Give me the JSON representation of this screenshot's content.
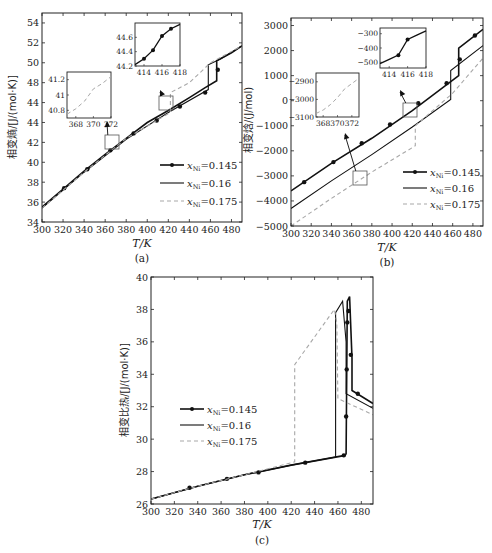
{
  "figure": {
    "panels": [
      "(a)",
      "(b)",
      "(c)"
    ]
  },
  "chart_data": [
    {
      "id": "a",
      "type": "line",
      "caption": "(a)",
      "title": "",
      "xlabel": "T/K",
      "ylabel": "相变熵/[J/(mol·K)]",
      "xlim": [
        300,
        490
      ],
      "ylim": [
        34,
        55
      ],
      "xticks": [
        300,
        320,
        340,
        360,
        380,
        400,
        420,
        440,
        460,
        480
      ],
      "yticks": [
        34,
        36,
        38,
        40,
        42,
        44,
        46,
        48,
        50,
        52,
        54
      ],
      "ytick_labels": [
        "34",
        "36",
        "38",
        "40",
        "42",
        "44",
        "44",
        "48",
        "50",
        "52",
        "54"
      ],
      "grid": false,
      "legend_position": "lower right",
      "legend": [
        "xNi=0.145",
        "xNi=0.16",
        "xNi=0.175"
      ],
      "legend_labels": [
        {
          "prefix": "x",
          "sub": "Ni",
          "suffix": "=0.145"
        },
        {
          "prefix": "x",
          "sub": "Ni",
          "suffix": "=0.16"
        },
        {
          "prefix": "x",
          "sub": "Ni",
          "suffix": "=0.175"
        }
      ],
      "series": [
        {
          "name": "xNi=0.145",
          "style": "solid-marker",
          "color": "#111111",
          "x": [
            300,
            320,
            340,
            360,
            380,
            400,
            420,
            440,
            455,
            466,
            466,
            480,
            490
          ],
          "y": [
            35.5,
            37.3,
            39.1,
            40.8,
            42.4,
            44.0,
            45.2,
            46.5,
            47.5,
            48.2,
            50.2,
            51.0,
            51.7
          ],
          "markers_x": [
            321,
            343,
            365,
            387,
            409,
            431,
            455,
            467
          ],
          "markers_y": [
            37.4,
            39.3,
            41.2,
            42.9,
            44.2,
            45.6,
            47.0,
            49.3
          ]
        },
        {
          "name": "xNi=0.16",
          "style": "solid",
          "color": "#111111",
          "x": [
            300,
            340,
            380,
            420,
            458,
            458,
            470,
            490
          ],
          "y": [
            35.4,
            39.0,
            42.3,
            45.0,
            47.3,
            49.8,
            50.4,
            51.7
          ]
        },
        {
          "name": "xNi=0.175",
          "style": "dashed",
          "color": "#aaaaaa",
          "x": [
            300,
            340,
            380,
            422,
            422,
            440,
            460,
            490
          ],
          "y": [
            35.4,
            39.0,
            42.4,
            45.0,
            47.0,
            48.0,
            50.0,
            51.7
          ]
        }
      ],
      "insets": [
        {
          "xlim": [
            367,
            372
          ],
          "ylim": [
            40.7,
            41.3
          ],
          "xticks": [
            368,
            370,
            372
          ],
          "yticks": [
            40.8,
            41,
            41.2
          ],
          "series": "xNi=0.175",
          "x": [
            367,
            368,
            369,
            370,
            371,
            372
          ],
          "y": [
            40.75,
            40.82,
            40.92,
            41.08,
            41.15,
            41.24
          ]
        },
        {
          "xlim": [
            413,
            418
          ],
          "ylim": [
            44.2,
            44.8
          ],
          "xticks": [
            414,
            416,
            418
          ],
          "yticks": [
            44.2,
            44.4,
            44.6
          ],
          "series": "xNi=0.145",
          "x": [
            413,
            414,
            415,
            416,
            417,
            418
          ],
          "y": [
            44.22,
            44.3,
            44.42,
            44.62,
            44.72,
            44.78
          ],
          "markers_x": [
            414,
            415,
            416,
            417
          ],
          "markers_y": [
            44.3,
            44.42,
            44.62,
            44.72
          ]
        }
      ]
    },
    {
      "id": "b",
      "type": "line",
      "caption": "(b)",
      "title": "",
      "xlabel": "T/K",
      "ylabel": "相变焓/(J/mol)",
      "xlim": [
        300,
        490
      ],
      "ylim": [
        -5000,
        3300
      ],
      "xticks": [
        300,
        320,
        340,
        360,
        380,
        400,
        420,
        440,
        460,
        480
      ],
      "yticks": [
        -5000,
        -4000,
        -3000,
        -2000,
        -1000,
        0,
        1000,
        2000,
        3000
      ],
      "ytick_labels": [
        "−5000",
        "−4000",
        "−3000",
        "−2000",
        "−1000",
        "0",
        "1000",
        "2000",
        "3000"
      ],
      "grid": false,
      "legend_position": "lower right",
      "legend": [
        "xNi=0.145",
        "xNi=0.16",
        "xNi=0.175"
      ],
      "legend_labels": [
        {
          "prefix": "x",
          "sub": "Ni",
          "suffix": "=0.145"
        },
        {
          "prefix": "x",
          "sub": "Ni",
          "suffix": "=0.16"
        },
        {
          "prefix": "x",
          "sub": "Ni",
          "suffix": "=0.175"
        }
      ],
      "series": [
        {
          "name": "xNi=0.145",
          "style": "solid-marker",
          "color": "#111111",
          "x": [
            300,
            340,
            380,
            420,
            466,
            466,
            490
          ],
          "y": [
            -3600,
            -2500,
            -1500,
            -400,
            1000,
            2100,
            2850
          ],
          "markers_x": [
            313,
            342,
            370,
            398,
            426,
            454,
            467,
            482
          ],
          "markers_y": [
            -3250,
            -2450,
            -1700,
            -950,
            -100,
            700,
            1650,
            2600
          ]
        },
        {
          "name": "xNi=0.16",
          "style": "solid",
          "color": "#111111",
          "x": [
            300,
            340,
            380,
            420,
            458,
            458,
            490
          ],
          "y": [
            -4300,
            -3200,
            -2150,
            -1050,
            50,
            1200,
            2200
          ]
        },
        {
          "name": "xNi=0.175",
          "style": "dashed",
          "color": "#aaaaaa",
          "x": [
            300,
            340,
            380,
            423,
            423,
            460,
            490
          ],
          "y": [
            -5000,
            -3900,
            -2850,
            -1800,
            -1000,
            300,
            1700
          ]
        }
      ],
      "insets": [
        {
          "xlim": [
            367,
            373
          ],
          "ylim": [
            -3100,
            -2850
          ],
          "xticks": [
            368,
            370,
            372
          ],
          "yticks": [
            -3100,
            -3000,
            -2900
          ],
          "series": "xNi=0.175",
          "x": [
            367,
            368,
            369,
            370,
            371,
            372,
            373
          ],
          "y": [
            -3080,
            -3060,
            -3030,
            -2990,
            -2940,
            -2910,
            -2880
          ]
        },
        {
          "xlim": [
            413,
            418
          ],
          "ylim": [
            -540,
            -260
          ],
          "xticks": [
            414,
            416,
            418
          ],
          "yticks": [
            -500,
            -400,
            -300
          ],
          "series": "xNi=0.145",
          "x": [
            413,
            414,
            415,
            416,
            417,
            418
          ],
          "y": [
            -510,
            -480,
            -450,
            -340,
            -310,
            -280
          ],
          "markers_x": [
            415,
            416
          ],
          "markers_y": [
            -450,
            -340
          ]
        }
      ]
    },
    {
      "id": "c",
      "type": "line",
      "caption": "(c)",
      "title": "",
      "xlabel": "T/K",
      "ylabel": "相变比热/[J/(mol·K)]",
      "xlim": [
        300,
        490
      ],
      "ylim": [
        26,
        40
      ],
      "xticks": [
        300,
        320,
        340,
        360,
        380,
        400,
        420,
        440,
        460,
        480
      ],
      "yticks": [
        26,
        28,
        30,
        32,
        34,
        36,
        38,
        40
      ],
      "ytick_labels": [
        "26",
        "28",
        "30",
        "32",
        "34",
        "36",
        "38",
        "40"
      ],
      "grid": false,
      "legend_position": "center left",
      "legend": [
        "xNi=0.145",
        "xNi=0.16",
        "xNi=0.175"
      ],
      "legend_labels": [
        {
          "prefix": "x",
          "sub": "Ni",
          "suffix": "=0.145"
        },
        {
          "prefix": "x",
          "sub": "Ni",
          "suffix": "=0.16"
        },
        {
          "prefix": "x",
          "sub": "Ni",
          "suffix": "=0.175"
        }
      ],
      "series": [
        {
          "name": "xNi=0.145",
          "style": "solid-marker",
          "color": "#111111",
          "x": [
            300,
            340,
            380,
            420,
            466,
            467,
            468,
            470,
            472,
            472,
            490
          ],
          "y": [
            26.3,
            27.1,
            27.8,
            28.4,
            29.0,
            29.1,
            38.5,
            38.8,
            35.0,
            33.0,
            32.2
          ],
          "markers_x": [
            333,
            365,
            392,
            432,
            465,
            467,
            468,
            467.5,
            469,
            471,
            477
          ],
          "markers_y": [
            27.0,
            27.55,
            27.95,
            28.55,
            29.0,
            31.4,
            37.2,
            34.3,
            37.9,
            35.2,
            32.8
          ]
        },
        {
          "name": "xNi=0.16",
          "style": "solid",
          "color": "#111111",
          "x": [
            300,
            340,
            380,
            420,
            458,
            458,
            464,
            467,
            467,
            490
          ],
          "y": [
            26.3,
            27.1,
            27.8,
            28.4,
            28.9,
            37.8,
            38.5,
            36.0,
            32.8,
            31.9
          ],
          "markers_x": [],
          "markers_y": []
        },
        {
          "name": "xNi=0.175",
          "style": "dashed",
          "color": "#aaaaaa",
          "x": [
            300,
            340,
            380,
            423,
            423,
            457,
            459,
            460,
            490
          ],
          "y": [
            26.3,
            27.1,
            27.8,
            28.6,
            34.6,
            38.0,
            37.2,
            32.5,
            31.5
          ],
          "markers_x": [],
          "markers_y": []
        }
      ]
    }
  ]
}
